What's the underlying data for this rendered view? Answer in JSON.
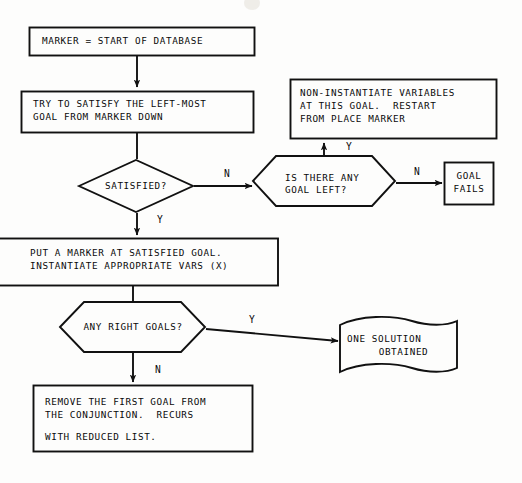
{
  "diagram": {
    "background_color": "#fdfdfc",
    "stroke_color": "#111111",
    "text_color": "#0a0a0a"
  },
  "nodes": {
    "start_marker": {
      "shape": "rectangle",
      "text": "MARKER = START OF DATABASE"
    },
    "try_satisfy": {
      "shape": "rectangle",
      "line1": "TRY TO SATISFY THE LEFT-MOST",
      "line2": "GOAL FROM MARKER DOWN"
    },
    "satisfied": {
      "shape": "diamond",
      "text": "SATISFIED?"
    },
    "any_goal_left": {
      "shape": "hexagon",
      "line1": "IS THERE ANY",
      "line2": "GOAL LEFT?"
    },
    "non_instantiate": {
      "shape": "rectangle",
      "line1": "NON-INSTANTIATE VARIABLES",
      "line2": "AT THIS GOAL.  RESTART",
      "line3": "FROM PLACE MARKER"
    },
    "goal_fails": {
      "shape": "rectangle",
      "line1": "GOAL",
      "line2": "FAILS"
    },
    "put_marker": {
      "shape": "rectangle",
      "line1": "PUT A MARKER AT SATISFIED GOAL.",
      "line2": "INSTANTIATE APPROPRIATE VARS (X)"
    },
    "any_right_goals": {
      "shape": "hexagon",
      "text": "ANY RIGHT GOALS?"
    },
    "one_solution": {
      "shape": "banner",
      "line1": "ONE SOLUTION",
      "line2": "OBTAINED"
    },
    "remove_first_goal": {
      "shape": "rectangle",
      "line1": "REMOVE THE FIRST GOAL FROM",
      "line2": "THE CONJUNCTION.  RECURS",
      "line3": "WITH REDUCED LIST."
    }
  },
  "edge_labels": {
    "satisfied_no": "N",
    "satisfied_yes": "Y",
    "goal_left_yes": "Y",
    "goal_left_no": "N",
    "right_goals_yes": "Y",
    "right_goals_no": "N"
  }
}
